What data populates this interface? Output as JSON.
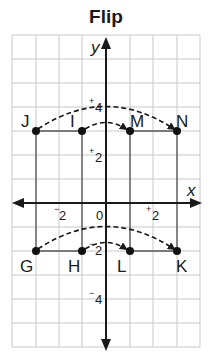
{
  "title": "Flip",
  "grid": {
    "x_min": -4,
    "x_max": 4,
    "y_min": -6,
    "y_max": 7,
    "origin_px": [
      106,
      203
    ],
    "unit_x_px": 23.5,
    "unit_y_px": 24,
    "grid_color": "#c8c8c8",
    "axis_color": "#1a1a1a"
  },
  "axes": {
    "x_label": "x",
    "y_label": "y",
    "origin_label": "0"
  },
  "ticks": [
    {
      "axis": "x",
      "value": -2,
      "sign": "−",
      "num": "2"
    },
    {
      "axis": "x",
      "value": 2,
      "sign": "+",
      "num": "2"
    },
    {
      "axis": "y",
      "value": 4,
      "sign": "+",
      "num": "4"
    },
    {
      "axis": "y",
      "value": 2,
      "sign": "+",
      "num": "2"
    },
    {
      "axis": "y",
      "value": -2,
      "sign": "−",
      "num": "2"
    },
    {
      "axis": "y",
      "value": -4,
      "sign": "−",
      "num": "4"
    }
  ],
  "points": [
    {
      "label": "J",
      "x": -3,
      "y": 3
    },
    {
      "label": "I",
      "x": -1,
      "y": 3
    },
    {
      "label": "M",
      "x": 1,
      "y": 3
    },
    {
      "label": "N",
      "x": 3,
      "y": 3
    },
    {
      "label": "G",
      "x": -3,
      "y": -2
    },
    {
      "label": "H",
      "x": -1,
      "y": -2
    },
    {
      "label": "L",
      "x": 1,
      "y": -2
    },
    {
      "label": "K",
      "x": 3,
      "y": -2
    }
  ],
  "shapes": [
    {
      "name": "original-rectangle",
      "vertices": [
        "J",
        "I",
        "H",
        "G"
      ]
    },
    {
      "name": "flipped-rectangle",
      "vertices": [
        "M",
        "N",
        "K",
        "L"
      ]
    }
  ],
  "arrows": [
    {
      "from": "J",
      "to": "N",
      "style": "dashed-arc"
    },
    {
      "from": "I",
      "to": "M",
      "style": "dashed-arc"
    },
    {
      "from": "G",
      "to": "K",
      "style": "dashed-arc"
    },
    {
      "from": "H",
      "to": "L",
      "style": "dashed-arc"
    }
  ]
}
